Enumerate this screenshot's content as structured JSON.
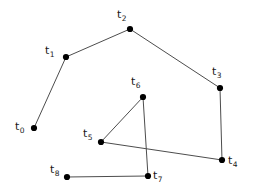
{
  "figure": {
    "type": "point-set-polyline-diagram",
    "background_color": "#ffffff",
    "stroke_color": "#4d4d4d",
    "node_fill_color": "#000000",
    "label_color": "#1a1a1a",
    "width": 254,
    "height": 195,
    "edge_stroke_width": 1
  },
  "nodes": [
    {
      "id": "t0",
      "base": "t",
      "sub": "0",
      "x": 34,
      "y": 128,
      "r": 3.1,
      "label_x": 15,
      "label_y": 121,
      "label_anchor": "left"
    },
    {
      "id": "t1",
      "base": "t",
      "sub": "1",
      "x": 66,
      "y": 57,
      "r": 3.1,
      "label_x": 45,
      "label_y": 45,
      "label_anchor": "left"
    },
    {
      "id": "t2",
      "base": "t",
      "sub": "2",
      "x": 130,
      "y": 29,
      "r": 3.1,
      "label_x": 117,
      "label_y": 9,
      "label_anchor": "left"
    },
    {
      "id": "t3",
      "base": "t",
      "sub": "3",
      "x": 220,
      "y": 88,
      "r": 3.1,
      "label_x": 212,
      "label_y": 66,
      "label_anchor": "left"
    },
    {
      "id": "t4",
      "base": "t",
      "sub": "4",
      "x": 222,
      "y": 160,
      "r": 3.1,
      "label_x": 228,
      "label_y": 155,
      "label_anchor": "left"
    },
    {
      "id": "t5",
      "base": "t",
      "sub": "5",
      "x": 101,
      "y": 142,
      "r": 3.1,
      "label_x": 83,
      "label_y": 128,
      "label_anchor": "left"
    },
    {
      "id": "t6",
      "base": "t",
      "sub": "6",
      "x": 143,
      "y": 97,
      "r": 3.1,
      "label_x": 131,
      "label_y": 76,
      "label_anchor": "left"
    },
    {
      "id": "t7",
      "base": "t",
      "sub": "7",
      "x": 148,
      "y": 176,
      "r": 3.1,
      "label_x": 153,
      "label_y": 170,
      "label_anchor": "left"
    },
    {
      "id": "t8",
      "base": "t",
      "sub": "8",
      "x": 67,
      "y": 177,
      "r": 3.1,
      "label_x": 50,
      "label_y": 164,
      "label_anchor": "left"
    }
  ],
  "edges": [
    {
      "from": "t0",
      "to": "t1"
    },
    {
      "from": "t1",
      "to": "t2"
    },
    {
      "from": "t2",
      "to": "t3"
    },
    {
      "from": "t3",
      "to": "t4"
    },
    {
      "from": "t4",
      "to": "t5"
    },
    {
      "from": "t5",
      "to": "t6"
    },
    {
      "from": "t6",
      "to": "t7"
    },
    {
      "from": "t7",
      "to": "t8"
    }
  ]
}
